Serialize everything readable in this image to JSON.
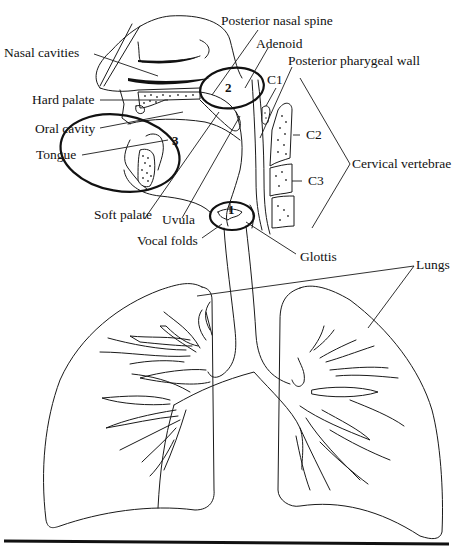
{
  "figure": {
    "labels": {
      "nasal_cavities": "Nasal cavities",
      "posterior_nasal_spine": "Posterior nasal spine",
      "adenoid": "Adenoid",
      "posterior_pharyngeal_wall": "Posterior pharygeal wall",
      "hard_palate": "Hard palate",
      "oral_cavity": "Oral cavity",
      "tongue": "Tongue",
      "soft_palate": "Soft palate",
      "uvula": "Uvula",
      "vocal_folds": "Vocal folds",
      "glottis": "Glottis",
      "lungs": "Lungs",
      "cervical_vertebrae": "Cervical vertebrae",
      "c1": "C1",
      "c2": "C2",
      "c3": "C3"
    },
    "regions": [
      {
        "number": "1",
        "description": "Vocal folds / glottis circle"
      },
      {
        "number": "2",
        "description": "Velopharyngeal circle"
      },
      {
        "number": "3",
        "description": "Oral cavity circle"
      }
    ]
  }
}
